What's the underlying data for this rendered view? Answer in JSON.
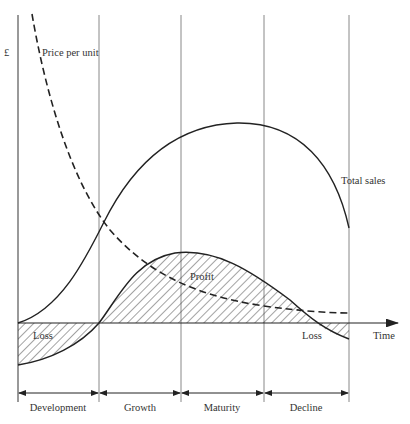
{
  "diagram": {
    "type": "product-life-cycle",
    "y_axis_label": "£",
    "x_axis_label": "Time",
    "curves": {
      "price": {
        "label": "Price per unit",
        "style": "dashed"
      },
      "sales": {
        "label": "Total sales",
        "style": "solid"
      },
      "profit": {
        "label": "Profit",
        "style": "solid"
      }
    },
    "regions": {
      "loss_early": "Loss",
      "profit": "Profit",
      "loss_late": "Loss"
    },
    "phases": [
      {
        "label": "Development"
      },
      {
        "label": "Growth"
      },
      {
        "label": "Maturity"
      },
      {
        "label": "Decline"
      }
    ],
    "colors": {
      "line": "#222222",
      "gridline": "#888888",
      "text": "#333333",
      "background": "#ffffff"
    }
  }
}
